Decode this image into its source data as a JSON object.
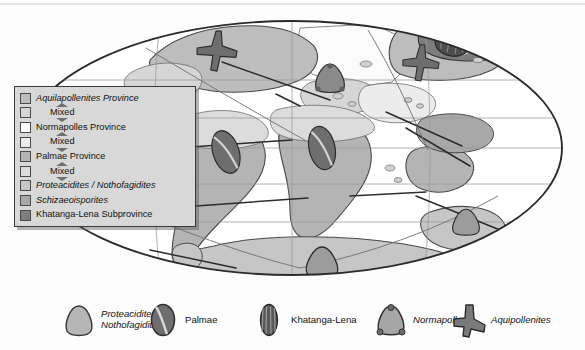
{
  "figure": {
    "projection": "oval (Mollweide-style) global paleogeographic map"
  },
  "colors": {
    "aquilapollenites": "#bdbdbd",
    "aquilapollenites_mixed": "#d6d6d6",
    "normapolles": "#ffffff",
    "normapolles_mixed": "#ececec",
    "palmae": "#b4b4b4",
    "palmae_mixed": "#dcdcdc",
    "proteacidites_nothofagidites": "#c6c6c6",
    "schizaeoisporites": "#a8a8a8",
    "khatanga_lena": "#7d7d7d",
    "outline": "#3a3a3a",
    "graticule": "#9a9a9a",
    "ocean": "#ffffff",
    "legend_background": "#d8d8d8"
  },
  "legend": {
    "entries": [
      {
        "label": "Aquilapollenites Province",
        "style": "italic",
        "swatch": "#bdbdbd",
        "mixed": false
      },
      {
        "label": "Mixed",
        "style": "roman",
        "swatch": "#d6d6d6",
        "mixed": true
      },
      {
        "label": "Normapolles Province",
        "style": "roman",
        "swatch": "#ffffff",
        "mixed": false
      },
      {
        "label": "Mixed",
        "style": "roman",
        "swatch": "#ececec",
        "mixed": true
      },
      {
        "label": "Palmae Province",
        "style": "roman",
        "swatch": "#b4b4b4",
        "mixed": false
      },
      {
        "label": "Mixed",
        "style": "roman",
        "swatch": "#dcdcdc",
        "mixed": true
      },
      {
        "label": "Proteacidites / Nothofagidites",
        "style": "italic",
        "swatch": "#c6c6c6",
        "mixed": false
      },
      {
        "label": "Schizaeoisporites",
        "style": "italic",
        "swatch": "#a8a8a8",
        "mixed": false
      },
      {
        "label": "Khatanga-Lena Subprovince",
        "style": "roman",
        "swatch": "#7d7d7d",
        "mixed": false
      }
    ]
  },
  "symbol_key": {
    "items": [
      {
        "name": "proteacidites-nothofagidites",
        "line1": "Proteacidites",
        "line2": "Nothofagidites",
        "style": "italic",
        "glyph": "rounded-triangle-grain"
      },
      {
        "name": "palmae",
        "line1": "Palmae",
        "line2": "",
        "style": "roman",
        "glyph": "monosulcate-ellipse-grain"
      },
      {
        "name": "khatanga-lena",
        "line1": "Khatanga-Lena",
        "line2": "",
        "style": "roman",
        "glyph": "striate-ellipse-grain"
      },
      {
        "name": "normapolles",
        "line1": "Normapolles",
        "line2": "",
        "style": "italic",
        "glyph": "triangular-pore-grain"
      },
      {
        "name": "aquipollenites",
        "line1": "Aquipollenites",
        "line2": "",
        "style": "italic",
        "glyph": "trilobed-y-grain"
      }
    ]
  },
  "map": {
    "graticule": {
      "parallels": [
        60,
        30,
        0,
        -30,
        -60
      ],
      "meridians": [
        -60,
        0,
        60
      ],
      "visible": true
    },
    "grain_markers": [
      {
        "symbol": "aquipollenites",
        "region": "north-america-western-interior"
      },
      {
        "symbol": "aquipollenites",
        "region": "northeast-asia"
      },
      {
        "symbol": "normapolles",
        "region": "europe"
      },
      {
        "symbol": "palmae",
        "region": "south-america"
      },
      {
        "symbol": "palmae",
        "region": "africa"
      },
      {
        "symbol": "khatanga-lena",
        "region": "siberia"
      },
      {
        "symbol": "proteacidites-nothofagidites",
        "region": "antarctica"
      },
      {
        "symbol": "proteacidites-nothofagidites",
        "region": "australia-india"
      }
    ]
  }
}
